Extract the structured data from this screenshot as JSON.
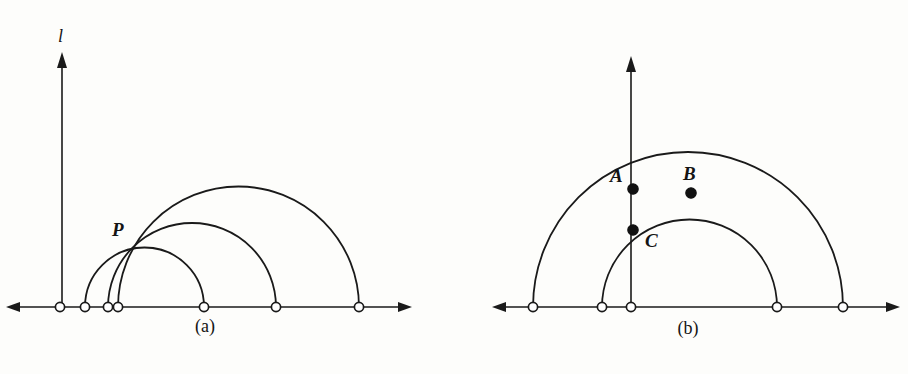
{
  "figure": {
    "background_color": "#fdfdfb",
    "ink_color": "#1a1a1a",
    "width": 908,
    "height": 374,
    "panels": [
      {
        "id": "panel-a",
        "caption": "(a)",
        "caption_x": 205,
        "caption_y": 332,
        "baseline_y": 307,
        "axis": {
          "name": "l",
          "label": "l",
          "label_x": 62,
          "label_y": 42,
          "x": 62,
          "top_y": 52,
          "bottom_y": 307
        },
        "horizontal_axis": {
          "left_x": 6,
          "right_x": 412,
          "y": 307
        },
        "open_nodes": [
          {
            "name": "node-a1",
            "x": 60,
            "y": 307
          },
          {
            "name": "node-a2",
            "x": 85,
            "y": 307
          },
          {
            "name": "node-a3",
            "x": 108,
            "y": 307
          },
          {
            "name": "node-a4",
            "x": 118,
            "y": 307
          },
          {
            "name": "node-a5",
            "x": 204,
            "y": 307
          },
          {
            "name": "node-a6",
            "x": 276,
            "y": 307
          },
          {
            "name": "node-a7",
            "x": 359,
            "y": 307
          }
        ],
        "arcs": [
          {
            "name": "arc-a-small",
            "left_x": 85,
            "right_x": 204,
            "center_x": 144.5,
            "radius": 59.5
          },
          {
            "name": "arc-a-medium",
            "left_x": 108,
            "right_x": 276,
            "center_x": 192,
            "radius": 84
          },
          {
            "name": "arc-a-large",
            "left_x": 118,
            "right_x": 359,
            "center_x": 238.5,
            "radius": 120.5
          }
        ],
        "marked_points": [
          {
            "name": "point-P",
            "label": "P",
            "x": 133,
            "y": 243,
            "label_x": 112,
            "label_y": 236,
            "filled": false
          }
        ]
      },
      {
        "id": "panel-b",
        "caption": "(b)",
        "caption_x": 688,
        "caption_y": 334,
        "baseline_y": 307,
        "axis": {
          "name": "vertical-axis",
          "label": "",
          "x": 631,
          "top_y": 56,
          "bottom_y": 307
        },
        "horizontal_axis": {
          "left_x": 492,
          "right_x": 900,
          "y": 307
        },
        "open_nodes": [
          {
            "name": "node-b1",
            "x": 533,
            "y": 307
          },
          {
            "name": "node-b2",
            "x": 602,
            "y": 307
          },
          {
            "name": "node-b3",
            "x": 631,
            "y": 307
          },
          {
            "name": "node-b4",
            "x": 777,
            "y": 307
          },
          {
            "name": "node-b5",
            "x": 843,
            "y": 307
          }
        ],
        "arcs": [
          {
            "name": "arc-b-large",
            "left_x": 533,
            "right_x": 843,
            "center_x": 688,
            "radius": 155
          },
          {
            "name": "arc-b-small",
            "left_x": 602,
            "right_x": 777,
            "center_x": 689.5,
            "radius": 87.5
          }
        ],
        "marked_points": [
          {
            "name": "point-A",
            "label": "A",
            "x": 633,
            "y": 189,
            "label_x": 612,
            "label_y": 182,
            "filled": true
          },
          {
            "name": "point-B",
            "label": "B",
            "x": 691,
            "y": 193,
            "label_x": 684,
            "label_y": 180,
            "filled": true
          },
          {
            "name": "point-C",
            "label": "C",
            "x": 633,
            "y": 230,
            "label_x": 644,
            "label_y": 245,
            "filled": true
          }
        ]
      }
    ]
  }
}
